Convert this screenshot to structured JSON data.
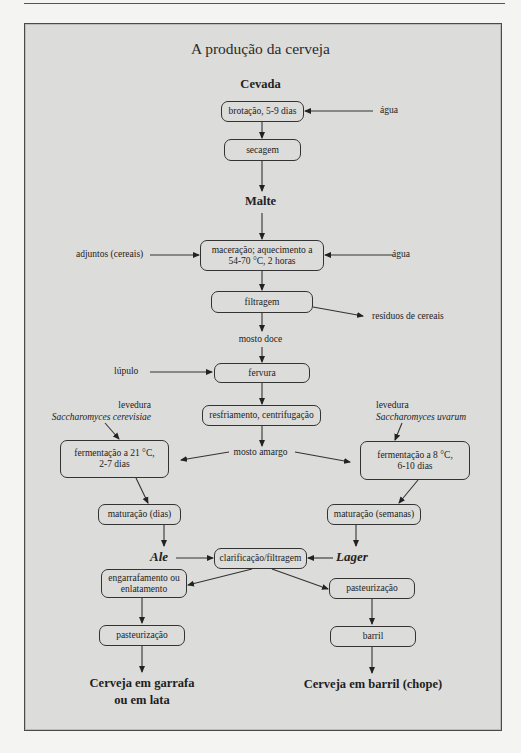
{
  "diagram": {
    "title": "A produção da cerveja",
    "start": "Cevada",
    "intermediate": "Malte",
    "nodes": {
      "brotacao": "brotação, 5-9 dias",
      "secagem": "secagem",
      "maceracao_l1": "maceração; aquecimento a",
      "maceracao_l2": "54-70 °C, 2 horas",
      "filtragem": "filtragem",
      "fervura": "fervura",
      "resfriamento": "resfriamento, centrifugação",
      "ferment_ale_l1": "fermentação a 21 °C,",
      "ferment_ale_l2": "2-7 dias",
      "ferment_lager_l1": "fermentação a 8 °C,",
      "ferment_lager_l2": "6-10 dias",
      "maturacao_ale": "maturação (dias)",
      "maturacao_lager": "maturação (semanas)",
      "clarificacao": "clarificação/filtragem",
      "engarrafamento_l1": "engarrafamento ou",
      "engarrafamento_l2": "enlatamento",
      "pasteurizacao_left": "pasteurização",
      "pasteurizacao_right": "pasteurização",
      "barril": "barril"
    },
    "labels": {
      "agua_1": "água",
      "adjuntos": "adjuntos (cereais)",
      "agua_2": "água",
      "residuos": "resíduos de cereais",
      "mosto_doce": "mosto doce",
      "lupulo": "lúpulo",
      "mosto_amargo": "mosto amargo",
      "levedura_left_l1": "levedura",
      "levedura_left_l2": "Saccharomyces cerevisiae",
      "levedura_right_l1": "levedura",
      "levedura_right_l2": "Saccharomyces uvarum",
      "ale": "Ale",
      "lager": "Lager"
    },
    "outputs": {
      "left_l1": "Cerveja em garrafa",
      "left_l2": "ou em lata",
      "right": "Cerveja em barril (chope)"
    }
  }
}
